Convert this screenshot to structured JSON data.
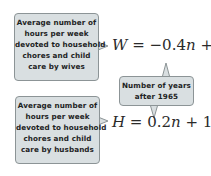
{
  "callouts": {
    "wives": {
      "lines": [
        "Average number of",
        "hours per week",
        "devoted to household",
        "chores and child",
        "care by wives"
      ]
    },
    "years": {
      "lines": [
        "Number of years",
        "after 1965"
      ]
    },
    "husbands": {
      "lines": [
        "Average number of",
        "hours per week",
        "devoted to household",
        "chores and child",
        "care by husbands"
      ]
    }
  },
  "equations": {
    "wives": {
      "var": "W",
      "rhs_prefix": " = −0.4",
      "n": "n",
      "rhs_suffix": " + 39"
    },
    "husbands": {
      "var": "H",
      "rhs_prefix": " = 0.2",
      "n": "n",
      "rhs_suffix": " + 12."
    }
  },
  "colors": {
    "callout_fill": "#d9dfe1",
    "callout_border": "#8c9496",
    "text": "#1d2324"
  }
}
